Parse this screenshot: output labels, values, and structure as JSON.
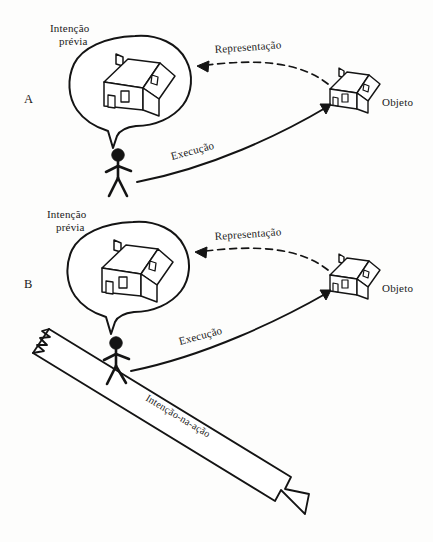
{
  "figure": {
    "background_color": "#fdfdfc",
    "ink_color": "#141414"
  },
  "panels": [
    {
      "id": "A",
      "label": "A",
      "thought_label_line1": "Intenção",
      "thought_label_line2": "prévia",
      "representation_label": "Representação",
      "object_label": "Objeto",
      "execution_label": "Execução"
    },
    {
      "id": "B",
      "label": "B",
      "thought_label_line1": "Intenção",
      "thought_label_line2": "prévia",
      "representation_label": "Representação",
      "object_label": "Objeto",
      "execution_label": "Execução",
      "ramp_label": "Intenção-na-ação"
    }
  ],
  "icons": {
    "house_thought": "house-icon",
    "house_object": "house-icon",
    "person": "stick-figure-icon",
    "thought_bubble": "thought-bubble-icon",
    "dashed_arrow": "dashed-arrow-icon",
    "solid_arrow": "solid-arrow-icon",
    "ramp_arrow": "ramp-arrow-icon"
  }
}
